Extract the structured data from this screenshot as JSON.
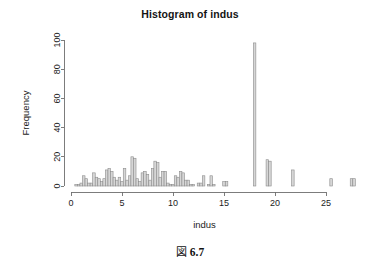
{
  "figure": {
    "caption_mark": "図",
    "caption_number": "6.7"
  },
  "chart_data": {
    "type": "bar",
    "title": "Histogram of indus",
    "subtitle": "",
    "xlabel": "indus",
    "ylabel": "Frequency",
    "xlim": [
      0,
      28
    ],
    "ylim": [
      0,
      100
    ],
    "grid": false,
    "legend": null,
    "bin_width": 0.25,
    "bar_fill": "#d6d6d6",
    "bar_stroke": "#8c8c8c",
    "axis_color": "#6e6e6e",
    "xticks": [
      0,
      5,
      10,
      15,
      20,
      25
    ],
    "xtick_labels": [
      "0",
      "5",
      "10",
      "15",
      "20",
      "25"
    ],
    "yticks": [
      0,
      20,
      40,
      60,
      80,
      100
    ],
    "ytick_labels": [
      "0",
      "20",
      "40",
      "60",
      "80",
      "100"
    ],
    "x": [
      0.5,
      0.75,
      1.0,
      1.25,
      1.5,
      1.75,
      2.0,
      2.25,
      2.5,
      2.75,
      3.0,
      3.25,
      3.5,
      3.75,
      4.0,
      4.25,
      4.5,
      4.75,
      5.0,
      5.25,
      5.5,
      5.75,
      6.0,
      6.25,
      6.5,
      6.75,
      7.0,
      7.25,
      7.5,
      7.75,
      8.0,
      8.25,
      8.5,
      8.75,
      9.0,
      9.25,
      9.5,
      9.75,
      10.0,
      10.25,
      10.5,
      10.75,
      11.0,
      11.25,
      11.5,
      11.75,
      12.0,
      12.5,
      12.75,
      13.0,
      13.5,
      13.75,
      14.0,
      15.0,
      15.25,
      18.0,
      19.25,
      19.5,
      21.75,
      25.5,
      27.5,
      27.75
    ],
    "values": [
      1,
      1,
      2,
      7,
      5,
      2,
      2,
      9,
      6,
      5,
      3,
      5,
      11,
      12,
      10,
      6,
      4,
      6,
      3,
      12,
      4,
      7,
      20,
      19,
      5,
      3,
      9,
      10,
      8,
      4,
      12,
      17,
      16,
      6,
      10,
      10,
      2,
      1,
      1,
      7,
      6,
      10,
      9,
      4,
      4,
      1,
      1,
      2,
      2,
      7,
      1,
      7,
      1,
      3,
      3,
      98,
      18,
      17,
      11,
      5,
      5,
      5
    ],
    "peak": {
      "x": 18.0,
      "value": 98,
      "label": ""
    }
  }
}
